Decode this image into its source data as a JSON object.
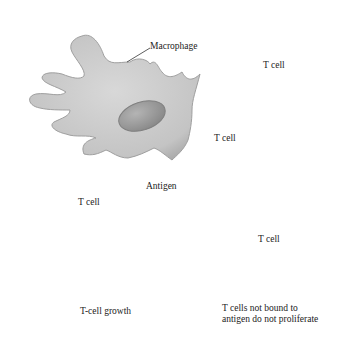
{
  "labels": {
    "macrophage": "Macrophage",
    "antigen": "Antigen",
    "bound_tcell": "T cell",
    "free_tcell_1": "T cell",
    "free_tcell_2": "T cell",
    "free_tcell_3": "T cell",
    "growth": "T-cell growth",
    "no_prolif_line1": "T cells not bound to",
    "no_prolif_line2": "antigen do not proliferate"
  },
  "colors": {
    "cell_fill": "#cfcfcf",
    "cell_edge": "#a8a8a8",
    "nucleus_fill": "#9a9a9a",
    "receptor": "#7a7a7a",
    "antigen": "#5a5a5a",
    "text": "#222222"
  }
}
